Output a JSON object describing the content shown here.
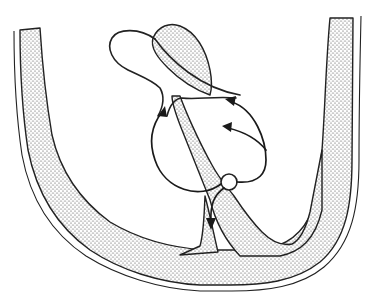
{
  "figure": {
    "type": "anatomical line drawing",
    "style": "stippled walls with flow arrows",
    "text_labels": [],
    "colors": {
      "background": "#ffffff",
      "ink": "#222222",
      "stipple": "#3a3a3a"
    }
  },
  "elements": {
    "outer_wall": "U-shaped stippled wall with double-line outer border",
    "septum": "diagonal stippled wall from upper center to lower right",
    "upper_lobe": "stippled tongue-shaped lobe at top center",
    "balloon": "unfilled balloon-shaped sac at upper left",
    "valve_ring": "small circle at lower end of septum",
    "arrows": [
      {
        "id": "left-loop",
        "description": "curve from valve ring up left side to upper branch"
      },
      {
        "id": "right-upper",
        "description": "curve from right loop into upper right opening"
      },
      {
        "id": "right-lower",
        "description": "curve from right loop into middle right opening"
      },
      {
        "id": "downward",
        "description": "arrow from valve ring pointing down"
      }
    ]
  }
}
